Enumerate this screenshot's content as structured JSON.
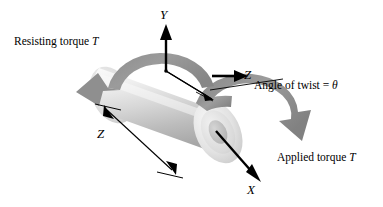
{
  "figure": {
    "background_color": "#ffffff",
    "line_color": "#000000",
    "torque_arrow_color": "#8c8c8c",
    "shaft_light_color": "#f2f2f2",
    "shaft_mid_color": "#c9c9c9",
    "shaft_dark_color": "#9a9a9a"
  },
  "labels": {
    "resisting_torque": "Resisting torque ",
    "resisting_torque_symbol": "T",
    "applied_torque": "Applied torque ",
    "applied_torque_symbol": "T",
    "angle_of_twist": "Angle of twist = ",
    "angle_of_twist_symbol": "θ",
    "axis_y": "Y",
    "axis_x": "X",
    "axis_z": "Z",
    "length_z": "Z"
  },
  "elements": {
    "shaft_name": "circular-shaft",
    "end_face_name": "shaft-end-face",
    "upper_torque_arc": "resisting-torque-arc",
    "lower_torque_arc": "applied-torque-arc",
    "y_axis_arrow": "y-axis-arrow",
    "x_axis_arrow": "x-axis-arrow",
    "z_axis_arrow": "z-axis-arrow",
    "length_dimension": "length-dimension-arrow",
    "twist_lines": "angle-of-twist-lines",
    "leader_line": "angle-of-twist-leader"
  }
}
